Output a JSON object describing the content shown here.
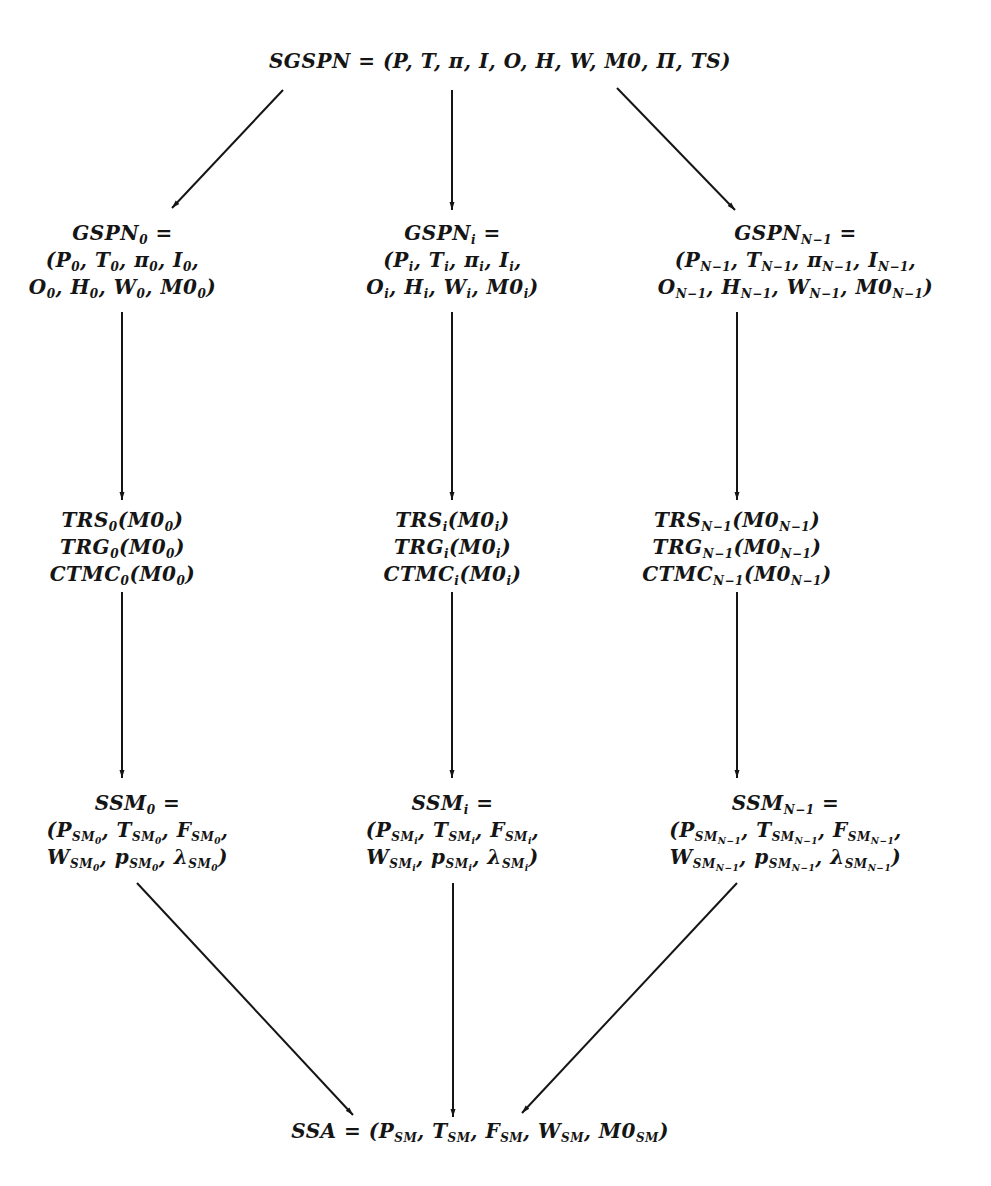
{
  "diagram": {
    "type": "hierarchical-decomposition",
    "root": {
      "id": "sgspn",
      "lines": [
        "SGSPN = (P, T, π, I, O, H, W, M0, Π, TS)"
      ]
    },
    "columns": [
      {
        "index": "0",
        "gspn": [
          "GSPN_0 =",
          "(P_0, T_0, π_0, I_0,",
          "O_0, H_0, W_0, M0_0)"
        ],
        "reach": [
          "TRS_0(M0_0)",
          "TRG_0(M0_0)",
          "CTMC_0(M0_0)"
        ],
        "ssm": [
          "SSM_0 =",
          "(P_SM_0, T_SM_0, F_SM_0,",
          "W_SM_0, p_SM_0, λ_SM_0)"
        ]
      },
      {
        "index": "i",
        "gspn": [
          "GSPN_i =",
          "(P_i, T_i, π_i, I_i,",
          "O_i, H_i, W_i, M0_i)"
        ],
        "reach": [
          "TRS_i(M0_i)",
          "TRG_i(M0_i)",
          "CTMC_i(M0_i)"
        ],
        "ssm": [
          "SSM_i =",
          "(P_SM_i, T_SM_i, F_SM_i,",
          "W_SM_i, p_SM_i, λ_SM_i)"
        ]
      },
      {
        "index": "N-1",
        "gspn": [
          "GSPN_N-1 =",
          "(P_N-1, T_N-1, π_N-1, I_N-1,",
          "O_N-1, H_N-1, W_N-1, M0_N-1)"
        ],
        "reach": [
          "TRS_N-1(M0_N-1)",
          "TRG_N-1(M0_N-1)",
          "CTMC_N-1(M0_N-1)"
        ],
        "ssm": [
          "SSM_N-1 =",
          "(P_SM_N-1, T_SM_N-1, F_SM_N-1,",
          "W_SM_N-1, p_SM_N-1, λ_SM_N-1)"
        ]
      }
    ],
    "sink": {
      "id": "ssa",
      "lines": [
        "SSA = (P_SM, T_SM, F_SM, W_SM, M0_SM)"
      ]
    },
    "edges": [
      [
        "SGSPN",
        "GSPN_0"
      ],
      [
        "SGSPN",
        "GSPN_i"
      ],
      [
        "SGSPN",
        "GSPN_N-1"
      ],
      [
        "GSPN_0",
        "TRS_0/TRG_0/CTMC_0"
      ],
      [
        "GSPN_i",
        "TRS_i/TRG_i/CTMC_i"
      ],
      [
        "GSPN_N-1",
        "TRS_N-1/TRG_N-1/CTMC_N-1"
      ],
      [
        "TRS_0/TRG_0/CTMC_0",
        "SSM_0"
      ],
      [
        "TRS_i/TRG_i/CTMC_i",
        "SSM_i"
      ],
      [
        "TRS_N-1/TRG_N-1/CTMC_N-1",
        "SSM_N-1"
      ],
      [
        "SSM_0",
        "SSA"
      ],
      [
        "SSM_i",
        "SSA"
      ],
      [
        "SSM_N-1",
        "SSA"
      ]
    ],
    "colors": {
      "ink": "#151515",
      "background": "#ffffff",
      "bleed_through": "#ececec"
    }
  },
  "labels": {
    "root": "SGSPN",
    "eq": "=",
    "sink": "SSA"
  }
}
